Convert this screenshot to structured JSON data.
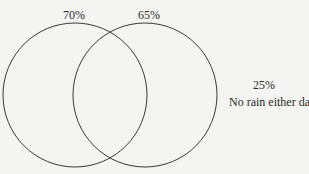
{
  "diagram": {
    "type": "venn",
    "sets": [
      {
        "id": "day1",
        "label": "70%",
        "cx": 75,
        "cy": 95,
        "r": 72
      },
      {
        "id": "day2",
        "label": "65%",
        "cx": 145,
        "cy": 95,
        "r": 72
      }
    ],
    "outside": {
      "value": "25%",
      "text": "No rain either day"
    },
    "stroke_color": "#3a3a3a",
    "background_color": "#f4f4f3"
  }
}
